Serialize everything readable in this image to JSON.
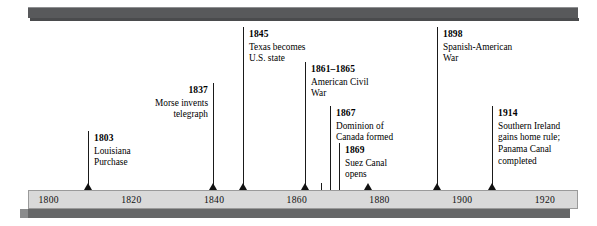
{
  "top_bar": {
    "label": "decorative-top-bar"
  },
  "axis": {
    "start_year": 1795,
    "end_year": 1928,
    "ticks": [
      {
        "year": 1800,
        "label": "1800"
      },
      {
        "year": 1820,
        "label": "1820"
      },
      {
        "year": 1840,
        "label": "1840"
      },
      {
        "year": 1860,
        "label": "1860"
      },
      {
        "year": 1880,
        "label": "1880"
      },
      {
        "year": 1900,
        "label": "1900"
      },
      {
        "year": 1920,
        "label": "1920"
      }
    ]
  },
  "events": [
    {
      "id": "louisiana-purchase",
      "year_label": "1803",
      "description": "Louisiana\nPurchase",
      "desc_lines": [
        "Louisiana",
        "Purchase"
      ],
      "align": "left",
      "line_x": 88,
      "text_top": 133,
      "line_top": 131,
      "marker_x": 88
    },
    {
      "id": "morse-telegraph",
      "year_label": "1837",
      "description": "Morse invents\ntelegraph",
      "desc_lines": [
        "Morse invents",
        "telegraph"
      ],
      "align": "right",
      "line_x": 213,
      "text_top": 85,
      "line_top": 83,
      "marker_x": 213
    },
    {
      "id": "texas-statehood",
      "year_label": "1845",
      "description": "Texas becomes\nU.S. state",
      "desc_lines": [
        "Texas becomes",
        "U.S. state"
      ],
      "align": "left",
      "line_x": 243,
      "text_top": 29,
      "line_top": 27,
      "marker_x": 243
    },
    {
      "id": "american-civil-war",
      "year_label": "1861–1865",
      "description": "American Civil\nWar",
      "desc_lines": [
        "American Civil",
        "War"
      ],
      "align": "left",
      "line_x": 305,
      "text_top": 64,
      "line_top": 62,
      "marker_x": 305
    },
    {
      "id": "dominion-of-canada",
      "year_label": "1867",
      "description": "Dominion of\nCanada formed",
      "desc_lines": [
        "Dominion of",
        "Canada formed"
      ],
      "align": "left",
      "line_x": 330,
      "text_top": 108,
      "line_top": 106,
      "marker_x": 368
    },
    {
      "id": "suez-canal",
      "year_label": "1869",
      "description": "Suez Canal\nopens",
      "desc_lines": [
        "Suez Canal",
        "opens"
      ],
      "align": "left",
      "line_x": 339,
      "text_top": 145,
      "line_top": 143,
      "marker_x": 368
    },
    {
      "id": "spanish-american-war",
      "year_label": "1898",
      "description": "Spanish-American\nWar",
      "desc_lines": [
        "Spanish-American",
        "War"
      ],
      "align": "left",
      "line_x": 437,
      "text_top": 29,
      "line_top": 27,
      "marker_x": 437
    },
    {
      "id": "ireland-home-rule-panama-canal",
      "year_label": "1914",
      "description": "Southern Ireland\ngains home rule;\nPanama Canal\ncompleted",
      "desc_lines": [
        "Southern Ireland",
        "gains home rule;",
        "Panama Canal",
        "completed"
      ],
      "align": "left",
      "line_x": 492,
      "text_top": 108,
      "line_top": 106,
      "marker_x": 492
    }
  ],
  "colors": {
    "top_bar": "#58595b",
    "axis_face": "#d9d9d9",
    "axis_shadow": "#666768",
    "line": "#1a1a1a",
    "text": "#000000"
  }
}
